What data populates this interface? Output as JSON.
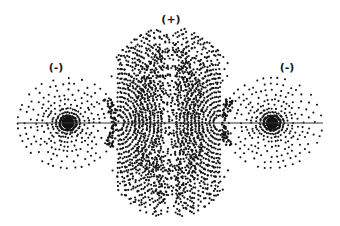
{
  "diagram": {
    "width": 340,
    "height": 226,
    "background": "#ffffff",
    "dot_color": "#141414",
    "axis": {
      "x1": 18,
      "x2": 323,
      "y": 123,
      "color": "#333333"
    },
    "labels": {
      "center": {
        "text": "(+)",
        "x": 171,
        "y": 19
      },
      "left": {
        "text": "(-)",
        "x": 56,
        "y": 67
      },
      "right": {
        "text": "(-)",
        "x": 287,
        "y": 67
      }
    },
    "lobes": [
      {
        "name": "left-negative-lobe",
        "sign": "-",
        "cx": 68,
        "cy": 123,
        "rx": 50,
        "ry": 45,
        "rays": 44,
        "rings": 11
      },
      {
        "name": "right-negative-lobe",
        "sign": "-",
        "cx": 272,
        "cy": 123,
        "rx": 50,
        "ry": 45,
        "rays": 44,
        "rings": 11
      }
    ],
    "central_lobe": {
      "name": "central-positive-lobe",
      "sign": "+",
      "cx": 170,
      "cy": 123,
      "rx": 74,
      "ry": 96,
      "waist": 0.68,
      "nodes": [
        {
          "cx": 118,
          "cy": 123
        },
        {
          "cx": 220,
          "cy": 123
        }
      ]
    }
  }
}
